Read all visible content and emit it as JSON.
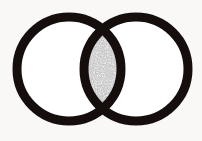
{
  "figure": {
    "type": "venn-diagram",
    "canvas": {
      "width": 202,
      "height": 141
    },
    "background_color": "#f9f8f7",
    "stroke_color": "#121110",
    "fill_color": "#ffffff",
    "intersection_fill_color": "#c9c9c9",
    "intersection_pattern": "stipple",
    "stroke_width": 9
  },
  "shapes": {
    "left_circle": {
      "name": "left-circle",
      "cx": 69,
      "cy": 69,
      "r": 52,
      "fill": "#ffffff",
      "stroke": "#121110",
      "stroke_width": 9
    },
    "right_circle": {
      "name": "right-circle",
      "cx": 136,
      "cy": 69,
      "r": 52,
      "fill": "#ffffff",
      "stroke": "#121110",
      "stroke_width": 9
    },
    "intersection": {
      "name": "intersection-lens",
      "label": "",
      "shaded": true,
      "top_crossing": {
        "x": 103,
        "y": 18
      },
      "bottom_crossing": {
        "x": 103,
        "y": 120
      },
      "left_extent": 84,
      "right_extent": 121
    }
  },
  "chart_data": {
    "type": "venn",
    "title": "",
    "sets": [
      {
        "name": "left-set",
        "label": "",
        "cx": 69,
        "cy": 69,
        "r": 52
      },
      {
        "name": "right-set",
        "label": "",
        "cx": 136,
        "cy": 69,
        "r": 52
      }
    ],
    "overlap": {
      "label": "",
      "shaded": true,
      "fill": "stipple-gray",
      "center_x": 103,
      "center_y": 69,
      "height": 102,
      "width": 37
    },
    "legend": [],
    "annotations": []
  }
}
